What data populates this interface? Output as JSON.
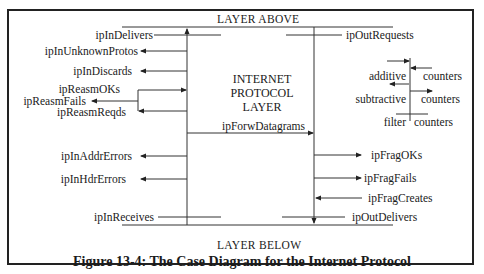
{
  "diagram": {
    "layer_above": "LAYER ABOVE",
    "layer_below": "LAYER BELOW",
    "center_title": [
      "INTERNET",
      "PROTOCOL",
      "LAYER"
    ],
    "caption": "Figure 13-4: The Case Diagram for the Internet Protocol",
    "left_counters": {
      "ipInDelivers": "ipInDelivers",
      "ipInUnknownProtos": "ipInUnknownProtos",
      "ipInDiscards": "ipInDiscards",
      "ipReasmOKs": "ipReasmOKs",
      "ipReasmFails": "ipReasmFails",
      "ipReasmReqds": "ipReasmReqds",
      "ipInAddrErrors": "ipInAddrErrors",
      "ipInHdrErrors": "ipInHdrErrors",
      "ipInReceives": "ipInReceives"
    },
    "middle_counters": {
      "ipForwDatagrams": "ipForwDatagrams"
    },
    "right_counters": {
      "ipOutRequests": "ipOutRequests",
      "ipFragOKs": "ipFragOKs",
      "ipFragFails": "ipFragFails",
      "ipFragCreates": "ipFragCreates",
      "ipOutDelivers": "ipOutDelivers"
    },
    "legend": {
      "additive": "additive",
      "subtractive": "subtractive",
      "filter": "filter",
      "counters": "counters"
    }
  }
}
